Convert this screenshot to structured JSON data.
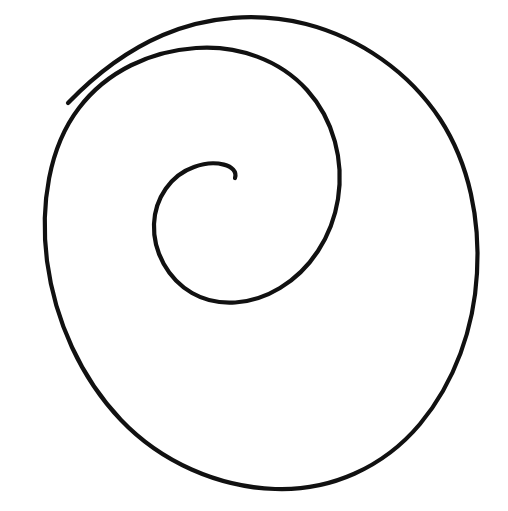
{
  "canvas": {
    "width": 508,
    "height": 511,
    "background_color": "#ffffff",
    "title": "Hand-drawn spiral"
  },
  "drawing": {
    "name": "spiral",
    "description": "A single continuous hand-drawn black spiral line, roughly two full turns, winding counterclockwise inward from a large outer loop to a small central curl.",
    "stroke_color": "#111111",
    "stroke_width": 4.2,
    "stroke_linecap": "round",
    "fill": "none",
    "turns": 2.15,
    "direction": "counterclockwise-inward",
    "outer_endpoint": {
      "x": 68,
      "y": 103
    },
    "inner_endpoint": {
      "x": 235,
      "y": 178
    },
    "outer_bounds": {
      "left": 34,
      "right": 478,
      "top": 18,
      "bottom": 488
    },
    "outer_center": {
      "x": 256,
      "y": 253
    },
    "outer_radius_x": 222,
    "outer_radius_y": 235,
    "inner_curl_center": {
      "x": 207,
      "y": 200
    },
    "inner_curl_radius": 28,
    "path_d": "M 68 103 C 96 74 128 50 163 35 C 208 16 258 12 306 24 C 360 38 409 72 440 119 C 470 165 480 221 477 273 C 474 328 455 382 420 424 C 383 468 330 491 275 489 C 218 487 161 462 121 420 C 81 378 55 321 47 261 C 40 205 49 147 79 108 C 107 71 151 51 196 48 C 238 45 280 60 307 90 C 334 120 344 161 338 199 C 332 237 310 270 280 288 C 252 305 218 308 192 293 C 168 279 153 252 154 224 C 155 198 171 175 194 167 C 215 159 239 165 235 178"
  }
}
